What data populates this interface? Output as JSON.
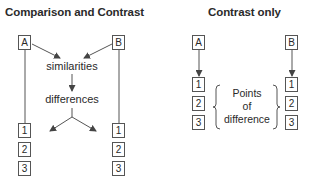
{
  "left_diagram": {
    "title": "Comparison and Contrast",
    "box_a": "A",
    "box_b": "B",
    "similarities": "similarities",
    "differences": "differences",
    "left_points": [
      "1",
      "2",
      "3"
    ],
    "right_points": [
      "1",
      "2",
      "3"
    ]
  },
  "right_diagram": {
    "title": "Contrast only",
    "box_a": "A",
    "box_b": "B",
    "left_points": [
      "1",
      "2",
      "3"
    ],
    "right_points": [
      "1",
      "2",
      "3"
    ],
    "brace_label": {
      "line1": "Points",
      "line2": "of",
      "line3": "difference"
    }
  },
  "colors": {
    "line": "#555555",
    "text": "#2a2a2a"
  }
}
